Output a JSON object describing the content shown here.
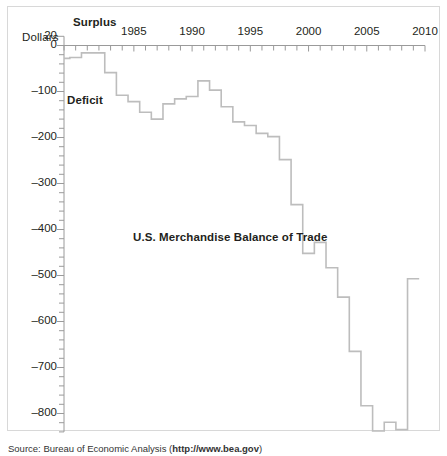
{
  "figure": {
    "source_prefix": "Source: Bureau of Economic Analysis (",
    "source_link": "http://www.bea.gov",
    "source_suffix": ")"
  },
  "labels": {
    "dollars": "Dollars",
    "surplus": "Surplus",
    "deficit": "Deficit"
  },
  "chart_data": {
    "type": "line",
    "subtype": "step",
    "title": "U.S. Merchandise Balance of Trade",
    "xlabel": "",
    "ylabel": "Dollars",
    "ylim": [
      -840,
      20
    ],
    "xlim": [
      1979,
      2010
    ],
    "grid": false,
    "legend": null,
    "y_ticks_major": [
      20,
      0,
      -100,
      -200,
      -300,
      -400,
      -500,
      -600,
      -700,
      -800
    ],
    "y_tick_labels": [
      "20",
      "0",
      "–100",
      "–200",
      "–300",
      "–400",
      "–500",
      "–600",
      "–700",
      "–800"
    ],
    "y_tick_minor_step": 20,
    "x_ticks_major": [
      1985,
      1990,
      1995,
      2000,
      2005,
      2010
    ],
    "x_tick_labels": [
      "1985",
      "1990",
      "1995",
      "2000",
      "2005",
      "2010"
    ],
    "x_tick_minor_step": 1,
    "annotations": [
      {
        "text": "Surplus",
        "position": "above-axis-left"
      },
      {
        "text": "Deficit",
        "position": "below-axis-left"
      },
      {
        "text": "U.S. Merchandise Balance of Trade",
        "position": "plot-center"
      }
    ],
    "units": "billions of dollars",
    "series_color": "#bdbdbd",
    "x": [
      1979,
      1980,
      1981,
      1982,
      1983,
      1984,
      1985,
      1986,
      1987,
      1988,
      1989,
      1990,
      1991,
      1992,
      1993,
      1994,
      1995,
      1996,
      1997,
      1998,
      1999,
      2000,
      2001,
      2002,
      2003,
      2004,
      2005,
      2006,
      2007,
      2008,
      2009
    ],
    "values": [
      -28,
      -26,
      -16,
      -16,
      -59,
      -108,
      -122,
      -145,
      -160,
      -127,
      -116,
      -111,
      -77,
      -97,
      -133,
      -166,
      -174,
      -191,
      -198,
      -248,
      -346,
      -452,
      -428,
      -483,
      -547,
      -665,
      -783,
      -838,
      -819,
      -835,
      -507
    ],
    "series": [
      {
        "name": "U.S. Merchandise Balance of Trade",
        "values": [
          -28,
          -26,
          -16,
          -16,
          -59,
          -108,
          -122,
          -145,
          -160,
          -127,
          -116,
          -111,
          -77,
          -97,
          -133,
          -166,
          -174,
          -191,
          -198,
          -248,
          -346,
          -452,
          -428,
          -483,
          -547,
          -665,
          -783,
          -838,
          -819,
          -835,
          -507
        ]
      }
    ]
  }
}
